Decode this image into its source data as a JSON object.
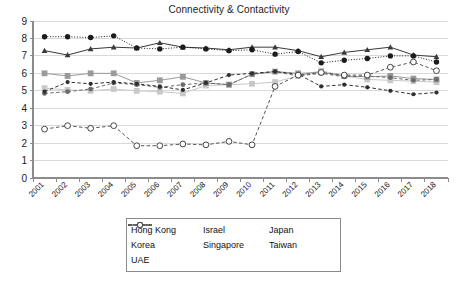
{
  "chart_data": {
    "type": "line",
    "title": "Connectivity & Contactivity",
    "xlabel": "",
    "ylabel": "",
    "ylim": [
      0,
      9
    ],
    "yticks": [
      0,
      1,
      2,
      3,
      4,
      5,
      6,
      7,
      8,
      9
    ],
    "grid": true,
    "legend_position": "bottom",
    "categories": [
      "2001",
      "2002",
      "2003",
      "2004",
      "2005",
      "2006",
      "2007",
      "2008",
      "2009",
      "2010",
      "2011",
      "2012",
      "2013",
      "2014",
      "2015",
      "2016",
      "2017",
      "2018"
    ],
    "series": [
      {
        "name": "Hong Kong",
        "marker": "triangle",
        "line": "solid",
        "color": "#3a3a3a",
        "values": [
          7.3,
          7.05,
          7.4,
          7.5,
          7.45,
          7.75,
          7.5,
          7.45,
          7.35,
          7.5,
          7.5,
          7.3,
          6.95,
          7.2,
          7.35,
          7.5,
          7.05,
          6.95
        ]
      },
      {
        "name": "Israel",
        "marker": "square",
        "line": "solid",
        "color": "#9a9a9a",
        "values": [
          6.0,
          5.85,
          6.0,
          6.0,
          5.45,
          5.6,
          5.8,
          5.45,
          5.35,
          5.95,
          6.1,
          6.0,
          6.05,
          5.85,
          5.8,
          5.85,
          5.7,
          5.65
        ]
      },
      {
        "name": "Japan",
        "marker": "square",
        "line": "solid",
        "color": "#c8c8c8",
        "values": [
          5.15,
          5.05,
          5.0,
          5.1,
          5.0,
          4.95,
          4.85,
          5.3,
          5.35,
          5.4,
          5.5,
          5.85,
          6.15,
          5.85,
          5.65,
          5.6,
          5.55,
          5.5
        ]
      },
      {
        "name": "Korea",
        "marker": "dot",
        "line": "dashed",
        "color": "#2f2f2f",
        "values": [
          4.95,
          5.5,
          5.4,
          5.5,
          5.4,
          5.25,
          5.05,
          5.45,
          5.9,
          6.0,
          6.1,
          5.95,
          5.25,
          5.35,
          5.2,
          5.0,
          4.8,
          4.9
        ]
      },
      {
        "name": "Singapore",
        "marker": "circle",
        "line": "dotted",
        "color": "#1c1c1c",
        "values": [
          8.1,
          8.1,
          8.05,
          8.15,
          7.45,
          7.4,
          7.5,
          7.4,
          7.3,
          7.35,
          7.1,
          7.25,
          6.6,
          6.75,
          6.85,
          7.0,
          7.0,
          6.65
        ]
      },
      {
        "name": "Taiwan",
        "marker": "circle-small",
        "line": "dashed",
        "color": "#6b6b6b",
        "values": [
          4.85,
          4.95,
          5.1,
          5.45,
          5.35,
          5.2,
          5.35,
          5.45,
          5.35,
          5.95,
          6.1,
          5.85,
          6.0,
          5.8,
          5.85,
          5.75,
          5.6,
          5.65
        ]
      },
      {
        "name": "UAE",
        "marker": "open-circle",
        "line": "dashed",
        "color": "#555555",
        "values": [
          2.8,
          3.0,
          2.85,
          3.0,
          1.85,
          1.85,
          1.95,
          1.9,
          2.1,
          1.9,
          5.25,
          5.9,
          6.05,
          5.9,
          5.9,
          6.35,
          6.65,
          6.15
        ]
      }
    ]
  },
  "legend": {
    "hong_kong": "Hong Kong",
    "israel": "Israel",
    "japan": "Japan",
    "korea": "Korea",
    "singapore": "Singapore",
    "taiwan": "Taiwan",
    "uae": "UAE"
  }
}
